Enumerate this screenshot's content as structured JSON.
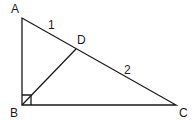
{
  "diagram": {
    "type": "right-triangle-with-altitude",
    "points": {
      "A": {
        "label": "A",
        "x": 22,
        "y": 18
      },
      "B": {
        "label": "B",
        "x": 22,
        "y": 105
      },
      "C": {
        "label": "C",
        "x": 176,
        "y": 105
      },
      "D": {
        "label": "D",
        "x": 76,
        "y": 49
      }
    },
    "segment_labels": {
      "AD": "1",
      "DC": "2"
    },
    "right_angle_at": "B",
    "line_color": "#1a1a1a",
    "background": "#ffffff"
  }
}
